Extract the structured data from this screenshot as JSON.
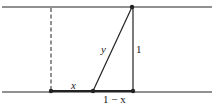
{
  "diagram": {
    "colors": {
      "stroke": "#222222",
      "background": "#ffffff"
    },
    "labels": {
      "x": "x",
      "y": "y",
      "height": "1",
      "remainder": "1 − x"
    },
    "points": {
      "left_bottom": [
        51,
        91
      ],
      "mid_bottom": [
        93,
        91
      ],
      "right_bottom": [
        133,
        91
      ],
      "top": [
        132,
        7
      ]
    },
    "lines": {
      "top_rail_y": 7,
      "bottom_rail_y": 92,
      "dashed_x": 51
    }
  }
}
